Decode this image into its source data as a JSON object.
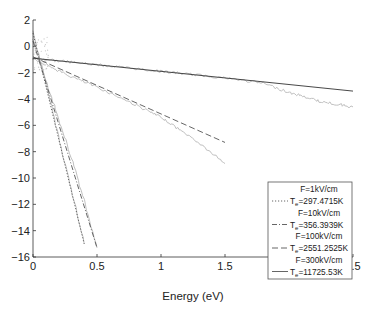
{
  "chart_data": {
    "type": "line",
    "title": "",
    "xlabel": "Energy (eV)",
    "ylabel": "",
    "xlim": [
      0,
      2.5
    ],
    "ylim": [
      -16,
      2
    ],
    "xticks": [
      "0",
      "0.5",
      "1",
      "1.5",
      "2",
      "2.5"
    ],
    "yticks": [
      "2",
      "0",
      "-2",
      "-4",
      "-6",
      "-8",
      "-10",
      "-12",
      "-14",
      "-16"
    ],
    "grid": false,
    "legend_position": "lower right",
    "legend": [
      {
        "field": "F=1kV/cm",
        "temp_prefix": "T",
        "temp_sub": "e",
        "temp_value": "=297.4715K",
        "style": "dotted"
      },
      {
        "field": "F=10kV/cm",
        "temp_prefix": "T",
        "temp_sub": "e",
        "temp_value": "=356.3939K",
        "style": "dash-dot"
      },
      {
        "field": "F=100kV/cm",
        "temp_prefix": "T",
        "temp_sub": "e",
        "temp_value": "=2551.2525K",
        "style": "dashed"
      },
      {
        "field": "F=300kV/cm",
        "temp_prefix": "T",
        "temp_sub": "e",
        "temp_value": "=11725.53K",
        "style": "solid"
      }
    ],
    "series": [
      {
        "name": "F=1kV/cm fit (Te=297.4715K)",
        "style": "dotted",
        "x": [
          0,
          0.4
        ],
        "y": [
          1.0,
          -15.0
        ]
      },
      {
        "name": "F=10kV/cm fit (Te=356.3939K)",
        "style": "dash-dot",
        "x": [
          0,
          0.5
        ],
        "y": [
          0.4,
          -15.3
        ]
      },
      {
        "name": "F=100kV/cm fit (Te=2551.2525K)",
        "style": "dashed",
        "x": [
          0,
          1.5
        ],
        "y": [
          -0.8,
          -7.3
        ]
      },
      {
        "name": "F=300kV/cm fit (Te=11725.53K)",
        "style": "solid",
        "x": [
          0,
          2.5
        ],
        "y": [
          -0.9,
          -3.4
        ]
      },
      {
        "name": "F=1kV/cm data",
        "style": "noisy-gray",
        "x": [
          0,
          0.1,
          0.2,
          0.3,
          0.4
        ],
        "y": [
          1.2,
          -2.8,
          -6.8,
          -10.9,
          -15.0
        ]
      },
      {
        "name": "F=10kV/cm data",
        "style": "noisy-gray",
        "x": [
          0,
          0.1,
          0.2,
          0.3,
          0.4,
          0.5
        ],
        "y": [
          0.6,
          -2.5,
          -5.5,
          -8.5,
          -11.6,
          -15.3
        ]
      },
      {
        "name": "F=100kV/cm data",
        "style": "noisy-gray",
        "x": [
          0,
          0.25,
          0.5,
          0.75,
          1.0,
          1.25,
          1.5
        ],
        "y": [
          -0.9,
          -2.1,
          -3.1,
          -4.2,
          -5.4,
          -7.0,
          -8.9
        ]
      },
      {
        "name": "F=300kV/cm data",
        "style": "noisy-gray",
        "x": [
          0,
          0.5,
          1.0,
          1.5,
          1.8,
          2.0,
          2.25,
          2.5
        ],
        "y": [
          -0.9,
          -1.4,
          -1.9,
          -2.4,
          -2.8,
          -3.5,
          -4.2,
          -4.6
        ]
      }
    ]
  }
}
